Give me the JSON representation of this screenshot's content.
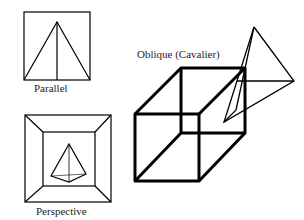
{
  "diagram": {
    "panels": [
      {
        "id": "parallel",
        "label": "Parallel"
      },
      {
        "id": "perspective",
        "label": "Perspective"
      },
      {
        "id": "oblique",
        "label": "Oblique (Cavalier)"
      }
    ]
  },
  "colors": {
    "stroke": "#000000",
    "background": "#ffffff",
    "text": "#222222"
  }
}
